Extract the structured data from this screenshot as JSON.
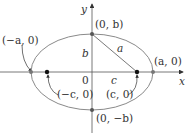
{
  "diagram": {
    "type": "ellipse-foci",
    "axes": {
      "x_label": "x",
      "y_label": "y"
    },
    "origin_label": "0",
    "points": {
      "top_vertex": "(0, b)",
      "bottom_vertex": "(0, −b)",
      "left_vertex": "(−a, 0)",
      "right_vertex": "(a, 0)",
      "left_focus": "(−c, 0)",
      "right_focus": "(c, 0)"
    },
    "segments": {
      "b": "b",
      "a": "a",
      "c": "c"
    },
    "colors": {
      "ellipse": "#8a8a8a",
      "axis": "#444444",
      "points": "#222222"
    }
  }
}
